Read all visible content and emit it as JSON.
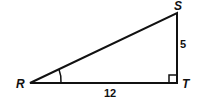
{
  "diagram": {
    "type": "right-triangle",
    "vertices": {
      "R": "R",
      "S": "S",
      "T": "T"
    },
    "sides": {
      "RT": "12",
      "ST": "5"
    },
    "right_angle_at": "T",
    "marked_angle_at": "R"
  }
}
